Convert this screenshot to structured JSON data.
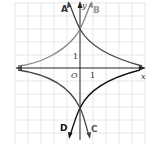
{
  "diagram": {
    "type": "function-graph",
    "axes": {
      "x_label": "x",
      "y_label": "y",
      "origin_label": "O",
      "x_tick_label": "1",
      "y_tick_label": "1"
    },
    "curves": [
      {
        "id": "A",
        "label": "A",
        "color": "#444444",
        "description": "rises steeply to upper-left, through (0,3), decays to right"
      },
      {
        "id": "B",
        "label": "B",
        "color": "#888888",
        "description": "rises steeply to upper-right, through (0,3), decays to left"
      },
      {
        "id": "C",
        "label": "C",
        "color": "#444444",
        "description": "falls steeply to lower-right, through (0,-3), approaches 0 to left"
      },
      {
        "id": "D",
        "label": "D",
        "color": "#111111",
        "description": "falls steeply to lower-left, through (0,-3), approaches 0 to right"
      }
    ],
    "y_intercepts": [
      3,
      -3
    ],
    "grid": {
      "on": true,
      "color": "#dddddd"
    }
  }
}
